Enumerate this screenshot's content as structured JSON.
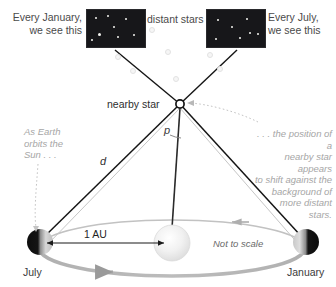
{
  "diagram": {
    "labels": {
      "january_view": "Every January,\nwe see this",
      "july_view": "Every July,\nwe see this",
      "distant_stars": "distant stars",
      "nearby_star": "nearby star",
      "parallax_angle": "p",
      "distance": "d",
      "as_earth_orbits": "As Earth\norbits the\nSun . . .",
      "position_shift": ". . . the position of a\nnearby star appears\nto shift against the\nbackground of\nmore distant\nstars.",
      "baseline": "1 AU",
      "not_to_scale": "Not to scale",
      "earth_july": "July",
      "earth_january": "January"
    },
    "colors": {
      "starbox_background": "#17171a",
      "star_dot": "#f4f4f0",
      "sightline": "#1a1a1a",
      "orbit": "#b5b5b5",
      "orbit_arrow": "#9a9a9a",
      "annotation_text": "#a6a6a6",
      "body_text": "#3a3a3a",
      "sun_fill": "#ededed",
      "earth_dark": "#101010",
      "earth_light": "#d8d8d8"
    },
    "starbox_january": {
      "stars": [
        {
          "x": 9,
          "y": 8,
          "r": 1.3
        },
        {
          "x": 21,
          "y": 6,
          "r": 1.0
        },
        {
          "x": 39,
          "y": 9,
          "r": 1.4
        },
        {
          "x": 27,
          "y": 17,
          "r": 1.2
        },
        {
          "x": 12,
          "y": 24,
          "r": 1.5
        },
        {
          "x": 31,
          "y": 27,
          "r": 1.3
        },
        {
          "x": 47,
          "y": 25,
          "r": 1.3
        },
        {
          "x": 5,
          "y": 30,
          "r": 0.9
        }
      ]
    },
    "starbox_july": {
      "stars": [
        {
          "x": 11,
          "y": 10,
          "r": 1.3
        },
        {
          "x": 40,
          "y": 9,
          "r": 1.3
        },
        {
          "x": 25,
          "y": 17,
          "r": 1.3
        },
        {
          "x": 43,
          "y": 23,
          "r": 1.3
        },
        {
          "x": 51,
          "y": 24,
          "r": 1.2
        },
        {
          "x": 9,
          "y": 29,
          "r": 1.3
        },
        {
          "x": 33,
          "y": 28,
          "r": 1.2
        }
      ]
    },
    "ghost_stars": [
      {
        "x": 117,
        "y": 56,
        "r": 2.4
      },
      {
        "x": 167,
        "y": 51,
        "r": 2.4
      },
      {
        "x": 209,
        "y": 54,
        "r": 2.4
      },
      {
        "x": 132,
        "y": 70,
        "r": 2.4
      },
      {
        "x": 175,
        "y": 78,
        "r": 2.4
      },
      {
        "x": 219,
        "y": 68,
        "r": 2.4
      },
      {
        "x": 151,
        "y": 29,
        "r": 2.4
      }
    ],
    "geometry": {
      "nearby_star": {
        "x": 180,
        "y": 104
      },
      "sun": {
        "x": 172,
        "y": 243,
        "r": 18
      },
      "earth_july": {
        "x": 40,
        "y": 242,
        "r": 13
      },
      "earth_january": {
        "x": 306,
        "y": 242,
        "r": 13
      },
      "box_january_target": {
        "x": 115,
        "y": 50
      },
      "box_july_target": {
        "x": 236,
        "y": 49
      },
      "orbit": {
        "cx": 172,
        "cy": 248,
        "rx": 133,
        "ry": 28
      }
    }
  }
}
